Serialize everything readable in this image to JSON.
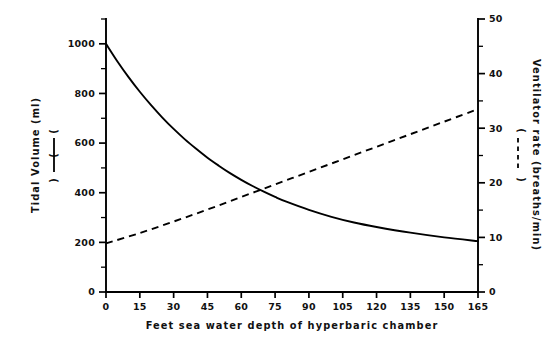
{
  "chart_data": {
    "type": "line",
    "title": "",
    "xlabel": "Feet sea water depth of hyperbaric chamber",
    "xticks": [
      0,
      15,
      30,
      45,
      60,
      75,
      90,
      105,
      120,
      135,
      150,
      165
    ],
    "xlim": [
      0,
      165
    ],
    "grid": false,
    "legend_position": "axis-labels",
    "left_axis": {
      "label_line1": "Tidal Volume (ml)",
      "label_line2": "(            )",
      "legend_style": "solid",
      "ticks": [
        0,
        200,
        400,
        600,
        800,
        1000
      ],
      "minor_tick_step": 100,
      "ylim": [
        0,
        1100
      ],
      "ticklabels": [
        "0",
        "200",
        "400",
        "600",
        "800",
        "1000"
      ]
    },
    "right_axis": {
      "label_line1": "Ventilator rate (breaths/min)",
      "label_line2": "(            )",
      "legend_style": "dashed",
      "ticks": [
        0,
        10,
        20,
        30,
        40,
        50
      ],
      "minor_tick_step": 5,
      "ylim": [
        0,
        50
      ],
      "ticklabels": [
        "0",
        "10",
        "20",
        "30",
        "40",
        "50"
      ]
    },
    "series": [
      {
        "name": "Tidal Volume (ml)",
        "style": "solid",
        "axis": "left",
        "units": "ml",
        "x": [
          0,
          5,
          10,
          15,
          20,
          25,
          30,
          35,
          40,
          45,
          50,
          55,
          60,
          65,
          70,
          75,
          80,
          90,
          100,
          110,
          120,
          135,
          150,
          165
        ],
        "values": [
          1000,
          930,
          866,
          807,
          753,
          703,
          657,
          615,
          577,
          541,
          509,
          479,
          452,
          427,
          404,
          383,
          364,
          331,
          303,
          280,
          262,
          239,
          220,
          205
        ]
      },
      {
        "name": "Ventilator rate (breaths/min)",
        "style": "dashed",
        "axis": "right",
        "units": "breaths/min",
        "x": [
          0,
          15,
          30,
          45,
          60,
          75,
          90,
          105,
          120,
          135,
          150,
          165
        ],
        "values": [
          8.9,
          10.8,
          12.9,
          15.1,
          17.4,
          19.7,
          22.0,
          24.3,
          26.6,
          28.9,
          31.2,
          33.5
        ]
      }
    ],
    "annotations": [
      {
        "text": "curves cross",
        "x_fsw": 56,
        "left_value_ml": 380,
        "right_value_breaths": 17.4
      }
    ]
  },
  "figure": {
    "background_color": "#ffffff",
    "ink_color": "#000000"
  }
}
